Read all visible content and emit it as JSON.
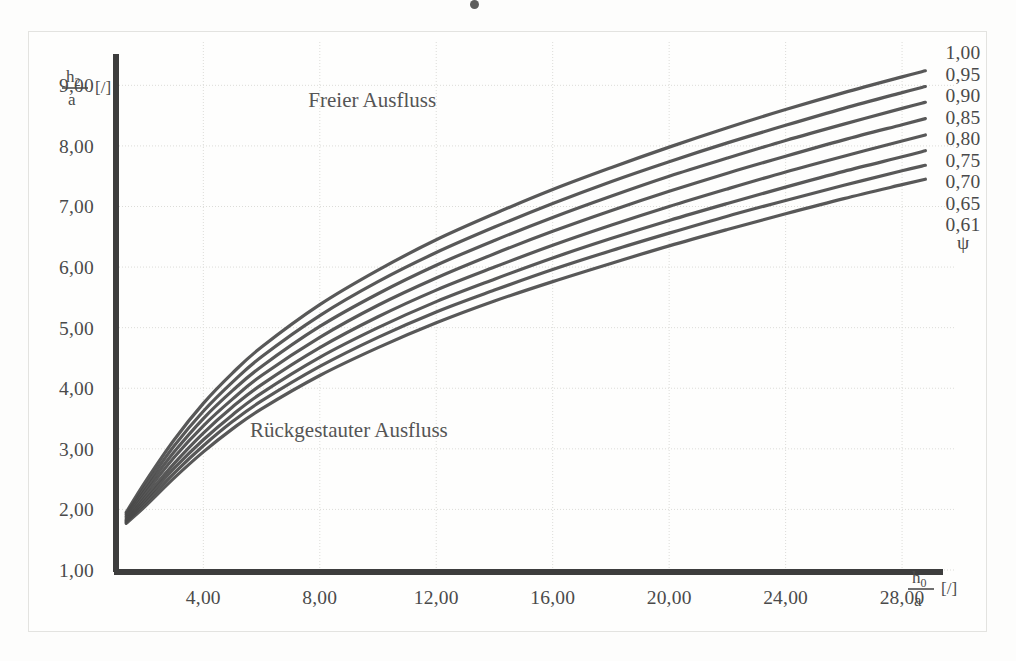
{
  "chart_data": {
    "type": "line",
    "title": "",
    "xlabel": "h0/a [/]",
    "ylabel": "h2/a [/]",
    "xlim": [
      1.0,
      29.2
    ],
    "ylim": [
      1.0,
      9.55
    ],
    "grid": true,
    "legend_position": "right",
    "xticks": [
      "4,00",
      "8,00",
      "12,00",
      "16,00",
      "20,00",
      "24,00",
      "28,00"
    ],
    "xtick_values": [
      4,
      8,
      12,
      16,
      20,
      24,
      28
    ],
    "yticks": [
      "1,00",
      "2,00",
      "3,00",
      "4,00",
      "5,00",
      "6,00",
      "7,00",
      "8,00",
      "9,00"
    ],
    "ytick_values": [
      1,
      2,
      3,
      4,
      5,
      6,
      7,
      8,
      9
    ],
    "annotations": [
      {
        "text": "Freier Ausfluss",
        "x": 9.8,
        "y": 8.65
      },
      {
        "text": "Rückgestauter Ausfluss",
        "x": 9.0,
        "y": 3.2
      }
    ],
    "right_axis_labels": [
      "1,00",
      "0,95",
      "0,90",
      "0,85",
      "0,80",
      "0,75",
      "0,70",
      "0,65",
      "0,61"
    ],
    "right_axis_symbol": "ψ",
    "series": [
      {
        "name": "0,90",
        "x": [
          1.35,
          2.0,
          3.0,
          4.0,
          5.0,
          6.0,
          8.0,
          10.0,
          12.0,
          14.0,
          16.0,
          18.0,
          20.0,
          22.0,
          24.0,
          26.0,
          28.0,
          28.8
        ],
        "values": [
          1.95,
          2.45,
          3.15,
          3.75,
          4.25,
          4.68,
          5.38,
          5.95,
          6.45,
          6.88,
          7.28,
          7.64,
          7.98,
          8.3,
          8.6,
          8.88,
          9.14,
          9.24
        ]
      },
      {
        "name": "0,85",
        "x": [
          1.35,
          2.0,
          3.0,
          4.0,
          5.0,
          6.0,
          8.0,
          10.0,
          12.0,
          14.0,
          16.0,
          18.0,
          20.0,
          22.0,
          24.0,
          26.0,
          28.0,
          28.8
        ],
        "values": [
          1.92,
          2.38,
          3.05,
          3.62,
          4.1,
          4.52,
          5.2,
          5.76,
          6.24,
          6.66,
          7.05,
          7.41,
          7.74,
          8.05,
          8.34,
          8.62,
          8.88,
          8.98
        ]
      },
      {
        "name": "0,80",
        "x": [
          1.35,
          2.0,
          3.0,
          4.0,
          5.0,
          6.0,
          8.0,
          10.0,
          12.0,
          14.0,
          16.0,
          18.0,
          20.0,
          22.0,
          24.0,
          26.0,
          28.0,
          28.8
        ],
        "values": [
          1.89,
          2.32,
          2.95,
          3.5,
          3.96,
          4.36,
          5.02,
          5.56,
          6.03,
          6.44,
          6.82,
          7.17,
          7.5,
          7.8,
          8.09,
          8.36,
          8.62,
          8.72
        ]
      },
      {
        "name": "0,75",
        "x": [
          1.35,
          2.0,
          3.0,
          4.0,
          5.0,
          6.0,
          8.0,
          10.0,
          12.0,
          14.0,
          16.0,
          18.0,
          20.0,
          22.0,
          24.0,
          26.0,
          28.0,
          28.8
        ],
        "values": [
          1.86,
          2.26,
          2.86,
          3.38,
          3.82,
          4.21,
          4.84,
          5.37,
          5.82,
          6.22,
          6.59,
          6.93,
          7.25,
          7.55,
          7.83,
          8.1,
          8.35,
          8.45
        ]
      },
      {
        "name": "0,70",
        "x": [
          1.35,
          2.0,
          3.0,
          4.0,
          5.0,
          6.0,
          8.0,
          10.0,
          12.0,
          14.0,
          16.0,
          18.0,
          20.0,
          22.0,
          24.0,
          26.0,
          28.0,
          28.8
        ],
        "values": [
          1.83,
          2.2,
          2.76,
          3.26,
          3.69,
          4.06,
          4.67,
          5.18,
          5.62,
          6.0,
          6.36,
          6.69,
          7.0,
          7.29,
          7.57,
          7.83,
          8.08,
          8.18
        ]
      },
      {
        "name": "0,65",
        "x": [
          1.35,
          2.0,
          3.0,
          4.0,
          5.0,
          6.0,
          8.0,
          10.0,
          12.0,
          14.0,
          16.0,
          18.0,
          20.0,
          22.0,
          24.0,
          26.0,
          28.0,
          28.8
        ],
        "values": [
          1.81,
          2.15,
          2.68,
          3.15,
          3.56,
          3.92,
          4.51,
          5.0,
          5.43,
          5.8,
          6.15,
          6.47,
          6.77,
          7.05,
          7.32,
          7.58,
          7.82,
          7.92
        ]
      },
      {
        "name": "0,63",
        "x": [
          1.35,
          2.0,
          3.0,
          4.0,
          5.0,
          6.0,
          8.0,
          10.0,
          12.0,
          14.0,
          16.0,
          18.0,
          20.0,
          22.0,
          24.0,
          26.0,
          28.0,
          28.8
        ],
        "values": [
          1.79,
          2.1,
          2.6,
          3.05,
          3.45,
          3.79,
          4.36,
          4.84,
          5.26,
          5.62,
          5.96,
          6.27,
          6.56,
          6.84,
          7.1,
          7.35,
          7.59,
          7.68
        ]
      },
      {
        "name": "0,61",
        "x": [
          1.35,
          2.0,
          3.0,
          4.0,
          5.0,
          6.0,
          8.0,
          10.0,
          12.0,
          14.0,
          16.0,
          18.0,
          20.0,
          22.0,
          24.0,
          26.0,
          28.0,
          28.8
        ],
        "values": [
          1.77,
          2.05,
          2.52,
          2.95,
          3.33,
          3.66,
          4.21,
          4.67,
          5.08,
          5.44,
          5.76,
          6.06,
          6.35,
          6.62,
          6.88,
          7.13,
          7.36,
          7.45
        ]
      }
    ],
    "colors": {
      "curve": "#4a4a4a",
      "axis": "#3d3d3d",
      "grid": "#dcdcd8",
      "text": "#4a4a4a",
      "background": "#fdfdfc"
    }
  }
}
